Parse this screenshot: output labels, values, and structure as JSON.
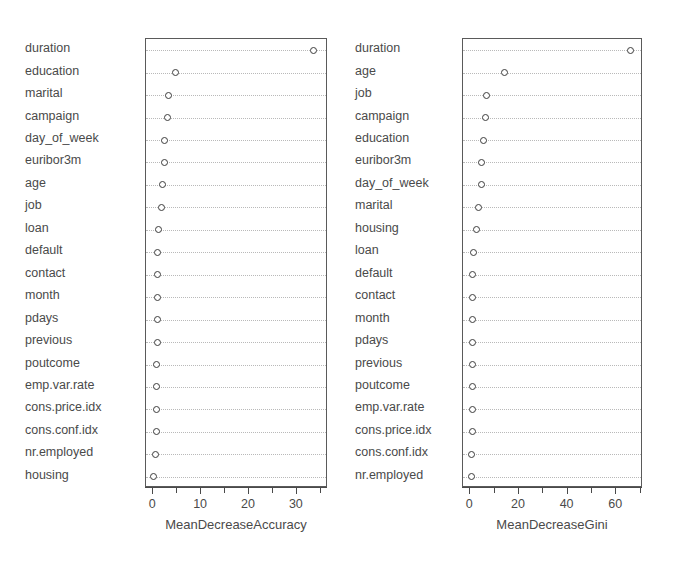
{
  "chart_data": [
    {
      "type": "scatter",
      "panel": "left",
      "title": "",
      "xlabel": "MeanDecreaseAccuracy",
      "ylabel": "",
      "xlim": [
        -1.5,
        36.5
      ],
      "xticks": [
        0,
        10,
        20,
        30
      ],
      "xtick_labels": [
        "0",
        "10",
        "20",
        "30"
      ],
      "xminor_ticks": [
        5,
        15,
        25,
        35
      ],
      "grid": "horizontal-dotted",
      "legend": "none",
      "categories": [
        "duration",
        "education",
        "marital",
        "campaign",
        "day_of_week",
        "euribor3m",
        "age",
        "job",
        "loan",
        "default",
        "contact",
        "month",
        "pdays",
        "previous",
        "poutcome",
        "emp.var.rate",
        "cons.price.idx",
        "cons.conf.idx",
        "nr.employed",
        "housing"
      ],
      "values": [
        33.5,
        4.7,
        3.2,
        3.0,
        2.4,
        2.3,
        1.9,
        1.7,
        1.1,
        0.95,
        0.9,
        0.85,
        0.8,
        0.8,
        0.75,
        0.7,
        0.6,
        0.6,
        0.5,
        0.0
      ]
    },
    {
      "type": "scatter",
      "panel": "right",
      "title": "",
      "xlabel": "MeanDecreaseGini",
      "ylabel": "",
      "xlim": [
        -3,
        71
      ],
      "xticks": [
        0,
        20,
        40,
        60
      ],
      "xtick_labels": [
        "0",
        "20",
        "40",
        "60"
      ],
      "xminor_ticks": [
        10,
        30,
        50,
        70
      ],
      "grid": "horizontal-dotted",
      "legend": "none",
      "categories": [
        "duration",
        "age",
        "job",
        "campaign",
        "education",
        "euribor3m",
        "day_of_week",
        "marital",
        "housing",
        "loan",
        "default",
        "contact",
        "month",
        "pdays",
        "previous",
        "poutcome",
        "emp.var.rate",
        "cons.price.idx",
        "cons.conf.idx",
        "nr.employed"
      ],
      "values": [
        66.0,
        14.0,
        6.6,
        6.1,
        5.4,
        4.8,
        4.4,
        3.3,
        2.4,
        1.5,
        0.9,
        0.8,
        0.8,
        0.8,
        0.75,
        0.75,
        0.7,
        0.7,
        0.65,
        0.6
      ]
    }
  ],
  "colors": {
    "point_stroke": "#3c3c3c",
    "point_fill": "#ffffff",
    "axis": "#4a4a4a",
    "gridline": "#b9b9b9",
    "text": "#4a4a4a",
    "background": "#ffffff"
  }
}
